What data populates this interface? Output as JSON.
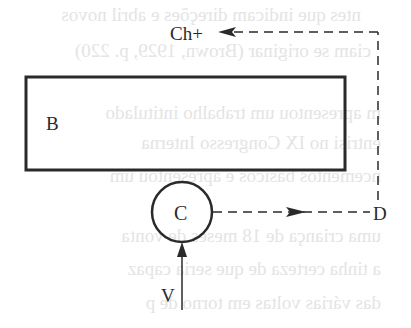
{
  "diagram": {
    "nodes": {
      "box_b": {
        "label": "B"
      },
      "circle_c": {
        "label": "C"
      },
      "node_d": {
        "label": "D"
      },
      "node_ch": {
        "label": "Ch+"
      },
      "input_v": {
        "label": "V"
      }
    },
    "edges": [
      {
        "from": "V",
        "to": "C",
        "style": "solid"
      },
      {
        "from": "C",
        "to": "D",
        "style": "dashed"
      },
      {
        "from": "D",
        "to": "Ch+",
        "style": "dashed"
      }
    ],
    "colors": {
      "ink": "#2a2a2a",
      "background": "#ffffff",
      "bleed_through": "#e4e4e4"
    }
  },
  "bleed_through_text": [
    "ntes que indicam direções e abril novos",
    "ciam se originar (Brown, 1929, p. 220)",
    "m apresentou um trabalho intitulado",
    "entrisi no IX Congresso Interna",
    "ncementos básicos e apresentou um",
    "uma criança de 18 meses de vonta",
    "a tinha certeza de que seria capaz",
    "das várias voltas em torno de p"
  ]
}
